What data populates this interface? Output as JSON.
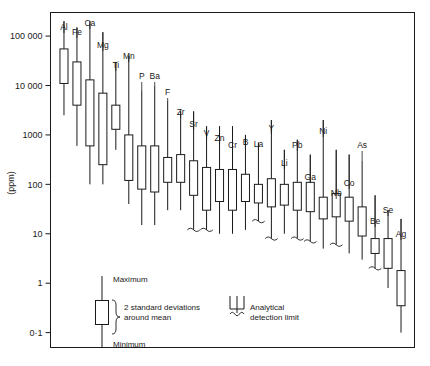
{
  "chart_data": {
    "type": "bar",
    "title": "",
    "subtitle": "",
    "xlabel": "",
    "ylabel": "(ppm)",
    "yscale": "log",
    "ylim": [
      0.05,
      300000
    ],
    "grid": false,
    "legend_position": "bottom-left-inset",
    "ytick_labels": [
      "100 000",
      "10 000",
      "1000",
      "100",
      "10",
      "1",
      "0·1"
    ],
    "ytick_values": [
      100000,
      10000,
      1000,
      100,
      10,
      1,
      0.1
    ],
    "categories": [
      "Al",
      "Fe",
      "Ca",
      "Mg",
      "Ti",
      "Mn",
      "P",
      "Ba",
      "F",
      "Zr",
      "Sr",
      "V",
      "Zn",
      "Cr",
      "B",
      "La",
      "Y",
      "Li",
      "Pb",
      "Ga",
      "Ni",
      "Nb",
      "Co",
      "As",
      "Be",
      "Se",
      "Ag"
    ],
    "series": [
      {
        "name": "Maximum",
        "values": [
          200000,
          150000,
          200000,
          120000,
          30000,
          40000,
          8000,
          10000,
          5000,
          3000,
          3000,
          1500,
          1500,
          1500,
          1000,
          700,
          2000,
          500,
          800,
          400,
          2000,
          500,
          400,
          300,
          60,
          30,
          20
        ]
      },
      {
        "name": "Mean + 2 s.d.",
        "values": [
          55000,
          30000,
          13000,
          7000,
          4000,
          1000,
          600,
          600,
          350,
          400,
          300,
          220,
          200,
          200,
          160,
          100,
          130,
          100,
          110,
          110,
          55,
          65,
          55,
          35,
          8,
          8,
          1.8
        ]
      },
      {
        "name": "Mean - 2 s.d.",
        "values": [
          11000,
          4000,
          600,
          250,
          1300,
          120,
          80,
          70,
          110,
          110,
          60,
          30,
          45,
          30,
          45,
          42,
          35,
          38,
          30,
          28,
          20,
          22,
          18,
          9,
          4,
          2,
          0.35
        ]
      },
      {
        "name": "Minimum",
        "values": [
          2500,
          600,
          100,
          100,
          500,
          40,
          15,
          15,
          30,
          30,
          12,
          12,
          10,
          10,
          12,
          18,
          8,
          10,
          8,
          7,
          5,
          6,
          4,
          3,
          2,
          0.8,
          0.1
        ]
      }
    ],
    "detection_limit_flags": [
      false,
      false,
      false,
      false,
      false,
      false,
      false,
      false,
      false,
      false,
      true,
      true,
      false,
      false,
      false,
      true,
      true,
      false,
      true,
      true,
      false,
      true,
      false,
      false,
      true,
      false,
      false
    ],
    "annotations": [
      "Maximum",
      "2 standard deviations around mean",
      "Minimum",
      "Analytical detection limit"
    ]
  },
  "legend": {
    "maximum_label": "Maximum",
    "stddev_label_line1": "2 standard deviations",
    "stddev_label_line2": "around mean",
    "minimum_label": "Minimum",
    "detection_label_line1": "Analytical",
    "detection_label_line2": "detection limit"
  },
  "axis": {
    "y_title": "(ppm)"
  },
  "colors": {
    "line": "#1a1a1a",
    "background": "#ffffff"
  }
}
